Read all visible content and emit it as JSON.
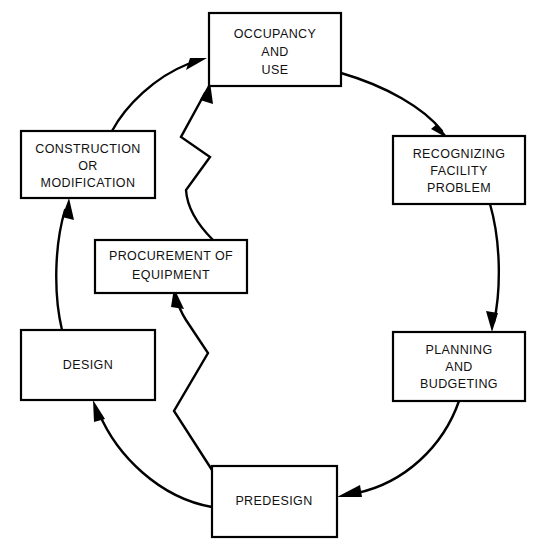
{
  "diagram": {
    "type": "cycle-flowchart",
    "background_color": "#ffffff",
    "line_color": "#000000",
    "text_color": "#111111",
    "nodes": [
      {
        "id": "occupancy-and-use",
        "lines": [
          "OCCUPANCY",
          "AND",
          "USE"
        ],
        "x": 209,
        "y": 13,
        "w": 132,
        "h": 73
      },
      {
        "id": "recognizing-facility-problem",
        "lines": [
          "RECOGNIZING",
          "FACILITY",
          "PROBLEM"
        ],
        "x": 393,
        "y": 136,
        "w": 132,
        "h": 68
      },
      {
        "id": "planning-and-budgeting",
        "lines": [
          "PLANNING",
          "AND",
          "BUDGETING"
        ],
        "x": 393,
        "y": 332,
        "w": 132,
        "h": 69
      },
      {
        "id": "predesign",
        "lines": [
          "PREDESIGN"
        ],
        "x": 212,
        "y": 466,
        "w": 125,
        "h": 71
      },
      {
        "id": "design",
        "lines": [
          "DESIGN"
        ],
        "x": 21,
        "y": 330,
        "w": 134,
        "h": 70
      },
      {
        "id": "construction-or-modification",
        "lines": [
          "CONSTRUCTION",
          "OR",
          "MODIFICATION"
        ],
        "x": 21,
        "y": 131,
        "w": 134,
        "h": 67
      },
      {
        "id": "procurement-of-equipment",
        "lines": [
          "PROCUREMENT OF",
          "EQUIPMENT"
        ],
        "x": 95,
        "y": 240,
        "w": 152,
        "h": 53
      }
    ],
    "connectors": [
      {
        "id": "occupancy-to-recognizing",
        "from": "occupancy-and-use",
        "to": "recognizing-facility-problem",
        "style": "curve"
      },
      {
        "id": "recognizing-to-planning",
        "from": "recognizing-facility-problem",
        "to": "planning-and-budgeting",
        "style": "curve"
      },
      {
        "id": "planning-to-predesign",
        "from": "planning-and-budgeting",
        "to": "predesign",
        "style": "curve"
      },
      {
        "id": "predesign-to-design",
        "from": "predesign",
        "to": "design",
        "style": "curve"
      },
      {
        "id": "design-to-construction",
        "from": "design",
        "to": "construction-or-modification",
        "style": "curve"
      },
      {
        "id": "construction-to-occupancy",
        "from": "construction-or-modification",
        "to": "occupancy-and-use",
        "style": "curve"
      },
      {
        "id": "predesign-to-procurement",
        "from": "predesign",
        "to": "procurement-of-equipment",
        "style": "zigzag"
      },
      {
        "id": "procurement-to-occupancy",
        "from": "procurement-of-equipment",
        "to": "occupancy-and-use",
        "style": "zigzag"
      }
    ]
  }
}
